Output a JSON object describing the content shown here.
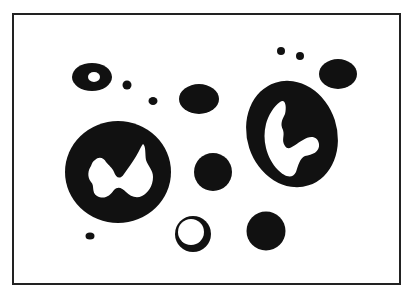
{
  "figure": {
    "background": "#ffffff",
    "ink": "#111111",
    "frame": {
      "x": 13,
      "y": 14,
      "width": 387,
      "height": 270,
      "stroke": "#222222",
      "stroke_width": 2
    },
    "blobs": [
      {
        "id": "ring-top-left",
        "kind": "ellipse-with-hole",
        "cx": 92,
        "cy": 77,
        "rx": 20,
        "ry": 14,
        "hole": {
          "cx": 94,
          "cy": 77,
          "rx": 6,
          "ry": 5
        }
      },
      {
        "id": "dot-1",
        "kind": "dot",
        "cx": 127,
        "cy": 85,
        "rx": 4.5,
        "ry": 4.5
      },
      {
        "id": "dot-2",
        "kind": "dot",
        "cx": 153,
        "cy": 101,
        "rx": 4.5,
        "ry": 4
      },
      {
        "id": "oval-top-mid",
        "kind": "ellipse",
        "cx": 199,
        "cy": 99,
        "rx": 20,
        "ry": 15
      },
      {
        "id": "dot-3",
        "kind": "dot",
        "cx": 281,
        "cy": 51,
        "rx": 4,
        "ry": 4
      },
      {
        "id": "dot-4",
        "kind": "dot",
        "cx": 300,
        "cy": 56,
        "rx": 4,
        "ry": 4
      },
      {
        "id": "oval-top-right",
        "kind": "ellipse",
        "cx": 338,
        "cy": 74,
        "rx": 19,
        "ry": 15
      },
      {
        "id": "large-cell-left",
        "kind": "cell",
        "cx": 118,
        "cy": 172,
        "rx": 53,
        "ry": 51
      },
      {
        "id": "large-cell-right",
        "kind": "cell",
        "cx": 292,
        "cy": 134,
        "rx": 45,
        "ry": 54
      },
      {
        "id": "circle-center",
        "kind": "ellipse",
        "cx": 213,
        "cy": 172,
        "rx": 20,
        "ry": 18
      },
      {
        "id": "ring-bottom",
        "kind": "ring",
        "cx": 193,
        "cy": 234,
        "rx": 18,
        "ry": 18
      },
      {
        "id": "circle-bottom-right",
        "kind": "ellipse",
        "cx": 266,
        "cy": 231,
        "rx": 20,
        "ry": 19
      },
      {
        "id": "dot-5",
        "kind": "dot",
        "cx": 90,
        "cy": 236,
        "rx": 4.5,
        "ry": 3.5
      }
    ]
  }
}
